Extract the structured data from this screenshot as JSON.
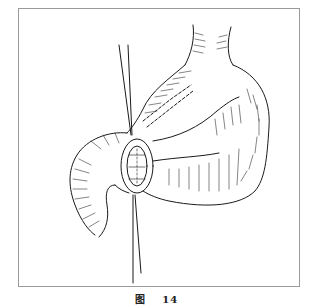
{
  "figure": {
    "caption_label": "图",
    "caption_number": "14",
    "illustration": "surgical-line-drawing-stomach-anastomosis",
    "colors": {
      "ink": "#1a1a1a",
      "frame": "#9a9a9a",
      "background": "#ffffff"
    }
  }
}
